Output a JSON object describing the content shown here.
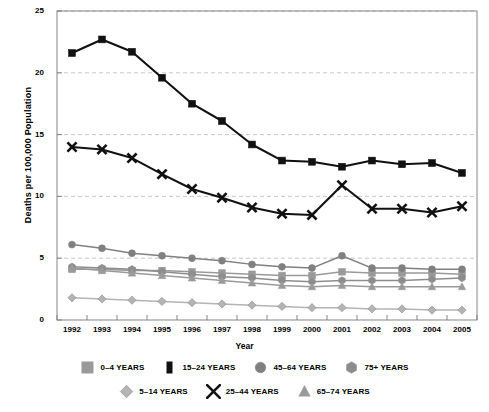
{
  "chart_data": {
    "type": "line",
    "title": "",
    "xlabel": "Year",
    "ylabel": "Deaths per 100,000 Population",
    "x": [
      1992,
      1993,
      1994,
      1995,
      1996,
      1997,
      1998,
      1999,
      2000,
      2001,
      2002,
      2003,
      2004,
      2005
    ],
    "xticklabels": [
      "1992",
      "1993",
      "1994",
      "1995",
      "1996",
      "1997",
      "1998",
      "1999",
      "2000",
      "2001",
      "2002",
      "2003",
      "2004",
      "2005"
    ],
    "ylim": [
      0,
      25
    ],
    "yticks": [
      0,
      5,
      10,
      15,
      20,
      25
    ],
    "yticklabels": [
      "0",
      "5",
      "10",
      "15",
      "20",
      "25"
    ],
    "grid": "horizontal-dashed",
    "legend_position": "bottom",
    "series": [
      {
        "name": "0-4 YEARS",
        "label": "0–4 YEARS",
        "marker": "square",
        "color": "#9a9a9a",
        "values": [
          4.1,
          4.1,
          4.0,
          4.0,
          3.9,
          3.8,
          3.7,
          3.6,
          3.6,
          3.9,
          3.8,
          3.8,
          3.8,
          3.7
        ]
      },
      {
        "name": "5-14 YEARS",
        "label": "5–14 YEARS",
        "marker": "diamond",
        "color": "#b4b4b4",
        "values": [
          1.8,
          1.7,
          1.6,
          1.5,
          1.4,
          1.3,
          1.2,
          1.1,
          1.0,
          1.0,
          0.9,
          0.9,
          0.8,
          0.8
        ]
      },
      {
        "name": "15-24 YEARS",
        "label": "15–24 YEARS",
        "marker": "square",
        "color": "#111111",
        "values": [
          21.6,
          22.7,
          21.7,
          19.6,
          17.5,
          16.1,
          14.2,
          12.9,
          12.8,
          12.4,
          12.9,
          12.6,
          12.7,
          11.9
        ]
      },
      {
        "name": "25-44 YEARS",
        "label": "25–44 YEARS",
        "marker": "x",
        "color": "#111111",
        "values": [
          14.0,
          13.8,
          13.1,
          11.8,
          10.6,
          9.9,
          9.1,
          8.6,
          8.5,
          10.9,
          9.0,
          9.0,
          8.7,
          9.2
        ]
      },
      {
        "name": "45-64 YEARS",
        "label": "45–64 YEARS",
        "marker": "circle",
        "color": "#808080",
        "values": [
          6.1,
          5.8,
          5.4,
          5.2,
          5.0,
          4.8,
          4.5,
          4.3,
          4.2,
          5.2,
          4.2,
          4.2,
          4.1,
          4.1
        ]
      },
      {
        "name": "65-74 YEARS",
        "label": "65–74 YEARS",
        "marker": "triangle",
        "color": "#9a9a9a",
        "values": [
          4.2,
          4.0,
          3.8,
          3.6,
          3.4,
          3.2,
          3.0,
          2.8,
          2.7,
          2.8,
          2.7,
          2.7,
          2.7,
          2.7
        ]
      },
      {
        "name": "75+ YEARS",
        "label": "75+ YEARS",
        "marker": "hexagon",
        "color": "#8d8d8d",
        "values": [
          4.3,
          4.2,
          4.1,
          3.9,
          3.7,
          3.5,
          3.4,
          3.2,
          3.1,
          3.2,
          3.2,
          3.2,
          3.3,
          3.4
        ]
      }
    ]
  }
}
